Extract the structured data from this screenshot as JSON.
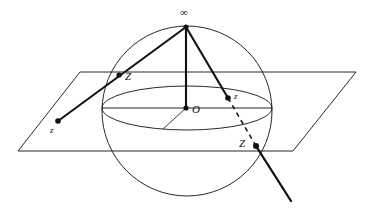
{
  "figure": {
    "background_color": "#ffffff",
    "stroke_color": "#111111",
    "width": 374,
    "height": 210
  },
  "labels": {
    "north_pole": "∞",
    "sphere_point_left": "Z",
    "plane_point_left": "z",
    "sphere_center": "O",
    "sphere_point_right": "z",
    "plane_point_right": "Z"
  },
  "geometry": {
    "sphere": {
      "cx": 187,
      "cy": 111,
      "r": 85
    },
    "equator": {
      "cx": 187,
      "cy": 108,
      "rx": 85,
      "ry": 22
    },
    "north_pole_point": {
      "x": 186,
      "y": 27
    },
    "center_point": {
      "x": 186,
      "y": 108
    },
    "plane_corners": [
      {
        "x": 80,
        "y": 72
      },
      {
        "x": 356,
        "y": 72
      },
      {
        "x": 293,
        "y": 151
      },
      {
        "x": 18,
        "y": 151
      }
    ],
    "marked_points": [
      {
        "name": "sphere-point-left",
        "x": 119,
        "y": 75
      },
      {
        "name": "plane-point-left",
        "x": 58,
        "y": 121
      },
      {
        "name": "sphere-point-right",
        "x": 228,
        "y": 98
      },
      {
        "name": "plane-point-right",
        "x": 256,
        "y": 146
      },
      {
        "name": "north-pole",
        "x": 186,
        "y": 27
      },
      {
        "name": "center",
        "x": 186,
        "y": 108
      }
    ],
    "rays": [
      {
        "name": "ray-left",
        "from": {
          "x": 186,
          "y": 27
        },
        "to": {
          "x": 58,
          "y": 121
        },
        "style": "solid"
      },
      {
        "name": "ray-right-solid",
        "from": {
          "x": 186,
          "y": 27
        },
        "to": {
          "x": 228,
          "y": 98
        },
        "style": "solid"
      },
      {
        "name": "ray-right-dashed",
        "from": {
          "x": 228,
          "y": 98
        },
        "to": {
          "x": 256,
          "y": 146
        },
        "style": "dashed"
      },
      {
        "name": "ray-right-extension",
        "from": {
          "x": 256,
          "y": 146
        },
        "to": {
          "x": 291,
          "y": 201
        },
        "style": "solid"
      },
      {
        "name": "polar-axis",
        "from": {
          "x": 186,
          "y": 27
        },
        "to": {
          "x": 186,
          "y": 108
        },
        "style": "solid"
      }
    ],
    "thin_lines": [
      {
        "name": "equatorial-diameter",
        "from": {
          "x": 102,
          "y": 108
        },
        "to": {
          "x": 272,
          "y": 108
        }
      },
      {
        "name": "equatorial-radius",
        "from": {
          "x": 186,
          "y": 108
        },
        "to": {
          "x": 163,
          "y": 129
        }
      }
    ],
    "label_positions": {
      "north_pole": {
        "x": 180,
        "y": 8
      },
      "sphere_point_left": {
        "x": 125,
        "y": 72
      },
      "plane_point_left": {
        "x": 50,
        "y": 126
      },
      "sphere_center": {
        "x": 192,
        "y": 104
      },
      "sphere_point_right": {
        "x": 234,
        "y": 93
      },
      "plane_point_right": {
        "x": 240,
        "y": 139
      }
    }
  }
}
